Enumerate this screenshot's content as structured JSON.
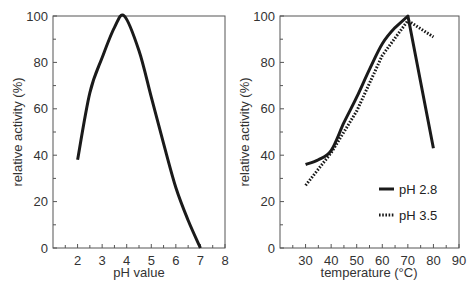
{
  "chart_data": [
    {
      "type": "line",
      "title": "",
      "xlabel": "pH value",
      "ylabel": "relative activity (%)",
      "xlim": [
        1,
        8
      ],
      "ylim": [
        0,
        100
      ],
      "x_ticks": [
        2,
        3,
        4,
        5,
        6,
        7,
        8
      ],
      "y_ticks": [
        0,
        20,
        40,
        60,
        80,
        100
      ],
      "grid": false,
      "legend": null,
      "series": [
        {
          "name": "activity vs pH",
          "style": "solid",
          "x": [
            2.0,
            2.5,
            3.0,
            3.5,
            3.9,
            4.5,
            5.0,
            5.5,
            6.0,
            6.5,
            7.0
          ],
          "y": [
            38,
            67,
            82,
            95,
            100,
            85,
            65,
            45,
            26,
            12,
            0
          ]
        }
      ]
    },
    {
      "type": "line",
      "title": "",
      "xlabel": "temperature (°C)",
      "ylabel": "relative activity (%)",
      "xlim": [
        20,
        90
      ],
      "ylim": [
        0,
        100
      ],
      "x_ticks": [
        30,
        40,
        50,
        60,
        70,
        80,
        90
      ],
      "y_ticks": [
        0,
        20,
        40,
        60,
        80,
        100
      ],
      "grid": false,
      "legend_position": "lower right",
      "series": [
        {
          "name": "pH 2.8",
          "style": "solid",
          "x": [
            30,
            35,
            40,
            45,
            50,
            55,
            60,
            65,
            70,
            80
          ],
          "y": [
            36,
            38,
            42,
            54,
            65,
            77,
            88,
            95,
            100,
            43
          ]
        },
        {
          "name": "pH 3.5",
          "style": "dotted",
          "x": [
            30,
            40,
            50,
            60,
            70,
            80
          ],
          "y": [
            27,
            41,
            59,
            83,
            98,
            91
          ]
        }
      ]
    }
  ]
}
